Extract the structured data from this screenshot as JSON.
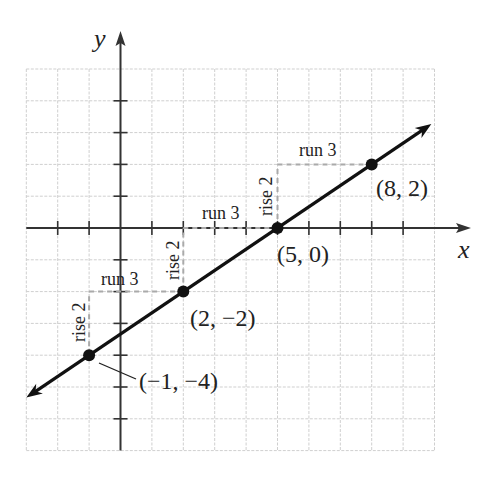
{
  "chart_data": {
    "type": "line",
    "title": "",
    "xlabel": "x",
    "ylabel": "y",
    "xlim": [
      -3,
      10
    ],
    "ylim": [
      -7,
      5
    ],
    "grid": true,
    "line": {
      "slope": 0.6667,
      "intercept": -3.3333,
      "equation": "y = (2/3)x - 10/3"
    },
    "points": [
      {
        "x": -1,
        "y": -4,
        "label": "(−1, −4)"
      },
      {
        "x": 2,
        "y": -2,
        "label": "(2, −2)"
      },
      {
        "x": 5,
        "y": 0,
        "label": "(5, 0)"
      },
      {
        "x": 8,
        "y": 2,
        "label": "(8, 2)"
      }
    ],
    "annotations": [
      {
        "type": "rise",
        "text": "rise 2",
        "from": [
          -1,
          -4
        ],
        "to": [
          -1,
          -2
        ]
      },
      {
        "type": "run",
        "text": "run 3",
        "from": [
          -1,
          -2
        ],
        "to": [
          2,
          -2
        ]
      },
      {
        "type": "rise",
        "text": "rise 2",
        "from": [
          2,
          -2
        ],
        "to": [
          2,
          0
        ]
      },
      {
        "type": "run",
        "text": "run 3",
        "from": [
          2,
          0
        ],
        "to": [
          5,
          0
        ]
      },
      {
        "type": "rise",
        "text": "rise 2",
        "from": [
          5,
          0
        ],
        "to": [
          5,
          2
        ]
      },
      {
        "type": "run",
        "text": "run 3",
        "from": [
          5,
          2
        ],
        "to": [
          8,
          2
        ]
      }
    ]
  },
  "labels": {
    "x_axis": "x",
    "y_axis": "y",
    "p1": "(−1, −4)",
    "p2": "(2, −2)",
    "p3": "(5, 0)",
    "p4": "(8, 2)",
    "rise1": "rise 2",
    "rise2": "rise 2",
    "rise3": "rise 2",
    "run1": "run 3",
    "run2": "run 3",
    "run3": "run 3"
  }
}
